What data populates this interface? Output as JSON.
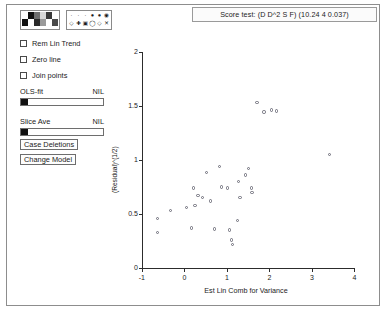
{
  "window": {
    "title_bar": {
      "text": "Score test: (D D^2 S F)  (10.24 4 0.037)"
    }
  },
  "panel": {
    "color_palette": {
      "name": "color-palette",
      "colors": [
        "#ffffff",
        "#111111",
        "#6f6f6f",
        "#d8d8d8",
        "#3a3a3a",
        "#ffffff",
        "#111111",
        "#ffffff",
        "#2a2a2a",
        "#9a9a9a",
        "#ffffff",
        "#4a4a4a"
      ]
    },
    "symbol_palette": {
      "name": "symbol-palette",
      "symbols": [
        "·",
        "·",
        "·",
        "●",
        "●",
        "◉",
        "◇",
        "✚",
        "▣",
        "◯",
        "◇",
        "✕"
      ]
    },
    "checkboxes": [
      {
        "label": "Rem Lin Trend",
        "checked": false
      },
      {
        "label": "Zero line",
        "checked": false
      },
      {
        "label": "Join points",
        "checked": false
      }
    ],
    "sliders": [
      {
        "label": "OLS-fit",
        "value": "NIL",
        "thumb_pct": 0
      },
      {
        "label": "Slice Ave",
        "value": "NIL",
        "thumb_pct": 0
      }
    ],
    "buttons": [
      {
        "label": "Case Deletions"
      },
      {
        "label": "Change Model"
      }
    ]
  },
  "chart_data": {
    "type": "scatter",
    "title": "Score test: (D D^2 S F)  (10.24 4 0.037)",
    "xlabel": "Est Lin Comb for Variance",
    "ylabel": "(Residual)^(1/2)",
    "xlim": [
      -1.35,
      4.25
    ],
    "ylim": [
      -0.08,
      2.1
    ],
    "xticks": [
      -1,
      0,
      1,
      2,
      3,
      4
    ],
    "xtick_labels": [
      "-1",
      "0",
      "1",
      "2",
      "3",
      "4"
    ],
    "yticks": [
      0,
      0.5,
      1,
      1.5,
      2
    ],
    "ytick_labels": [
      "0",
      "0.5",
      "1",
      "1.5",
      "2"
    ],
    "grid": false,
    "legend": "none",
    "marker": "open-circle",
    "marker_color": "#6b6b77",
    "points": [
      {
        "x": -0.62,
        "y": 0.46
      },
      {
        "x": -0.32,
        "y": 0.53
      },
      {
        "x": -0.63,
        "y": 0.33
      },
      {
        "x": 0.05,
        "y": 0.56
      },
      {
        "x": 0.26,
        "y": 0.58
      },
      {
        "x": 0.22,
        "y": 0.74
      },
      {
        "x": 0.18,
        "y": 0.37
      },
      {
        "x": 0.33,
        "y": 0.67
      },
      {
        "x": 0.44,
        "y": 0.65
      },
      {
        "x": 0.53,
        "y": 0.88
      },
      {
        "x": 0.62,
        "y": 0.62
      },
      {
        "x": 0.72,
        "y": 0.36
      },
      {
        "x": 0.84,
        "y": 0.94
      },
      {
        "x": 0.88,
        "y": 0.75
      },
      {
        "x": 1.02,
        "y": 0.74
      },
      {
        "x": 1.07,
        "y": 0.35
      },
      {
        "x": 1.12,
        "y": 0.26
      },
      {
        "x": 1.14,
        "y": 0.22
      },
      {
        "x": 1.25,
        "y": 0.44
      },
      {
        "x": 1.28,
        "y": 0.8
      },
      {
        "x": 1.32,
        "y": 0.65
      },
      {
        "x": 1.45,
        "y": 0.86
      },
      {
        "x": 1.52,
        "y": 0.92
      },
      {
        "x": 1.58,
        "y": 0.74
      },
      {
        "x": 1.6,
        "y": 0.7
      },
      {
        "x": 1.72,
        "y": 1.53
      },
      {
        "x": 1.88,
        "y": 1.44
      },
      {
        "x": 2.05,
        "y": 1.46
      },
      {
        "x": 2.18,
        "y": 1.45
      },
      {
        "x": 3.42,
        "y": 1.05
      }
    ]
  }
}
